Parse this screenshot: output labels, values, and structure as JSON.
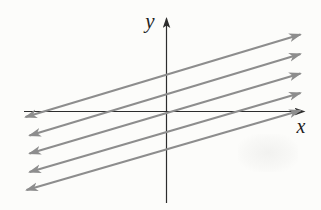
{
  "figure": {
    "width": 321,
    "height": 210,
    "background": "#fcfcfa",
    "axes": {
      "color": "#2d2d2d",
      "stroke_width": 1.2,
      "x": {
        "label": "x",
        "from": [
          24,
          111.5
        ],
        "to": [
          304,
          111.5
        ],
        "label_pos": [
          301,
          133
        ]
      },
      "y": {
        "label": "y",
        "from": [
          166.5,
          203
        ],
        "to": [
          166.5,
          18.5
        ],
        "label_pos": [
          150,
          28
        ]
      }
    },
    "lines": {
      "color": "#8d8d8d",
      "stroke_width": 2.2,
      "arrowheads": "both-ends",
      "count": 5,
      "segments": [
        [
          25.5,
          117.0,
          300.5,
          34.5
        ],
        [
          29.5,
          135.5,
          300.5,
          54.0
        ],
        [
          29.5,
          153.5,
          300.5,
          73.5
        ],
        [
          29.5,
          172.0,
          300.5,
          93.0
        ],
        [
          26.5,
          190.0,
          300.5,
          110.5
        ]
      ]
    }
  }
}
